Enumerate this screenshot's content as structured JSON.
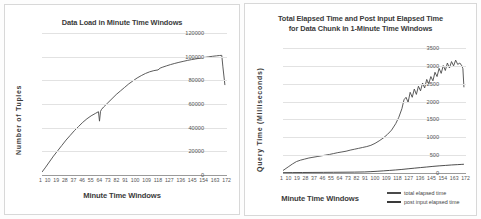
{
  "chart_data": [
    {
      "type": "line",
      "title": "Data Load in Minute Time Windows",
      "xlabel": "Minute Time Windows",
      "ylabel": "Number of Tuples",
      "xticks": [
        "1",
        "10",
        "19",
        "28",
        "37",
        "46",
        "55",
        "64",
        "73",
        "82",
        "91",
        "100",
        "109",
        "118",
        "127",
        "136",
        "145",
        "154",
        "163",
        "172"
      ],
      "yticks": [
        "0",
        "20000",
        "40000",
        "60000",
        "80000",
        "100000",
        "120000"
      ],
      "ylim": [
        0,
        120000
      ],
      "xlim": [
        1,
        178
      ],
      "grid": true,
      "legend": "none",
      "series": [
        {
          "name": "number of tuples",
          "color": "#4a4a4a",
          "x": [
            1,
            4,
            8,
            12,
            16,
            20,
            24,
            28,
            32,
            36,
            40,
            44,
            48,
            52,
            55,
            56,
            57,
            58,
            60,
            64,
            68,
            72,
            76,
            80,
            84,
            88,
            92,
            96,
            100,
            104,
            108,
            112,
            114,
            116,
            120,
            124,
            128,
            132,
            136,
            140,
            144,
            148,
            152,
            156,
            160,
            164,
            168,
            171,
            173,
            174,
            176
          ],
          "values": [
            2500,
            6000,
            11000,
            16000,
            20500,
            25000,
            29500,
            33500,
            37500,
            41000,
            44500,
            47500,
            50000,
            52000,
            53500,
            45500,
            53800,
            55500,
            57500,
            61000,
            64500,
            68000,
            71000,
            74000,
            77000,
            79500,
            82000,
            84000,
            85800,
            87200,
            88200,
            88800,
            90300,
            91000,
            92200,
            93300,
            94300,
            95200,
            96000,
            96800,
            97500,
            98100,
            98700,
            99300,
            99800,
            100300,
            100700,
            101000,
            101100,
            92000,
            76000
          ]
        }
      ]
    },
    {
      "type": "line",
      "title_line1": "Total Elapsed Time and Post Input Elapsed Time",
      "title_line2": "for Data Chunk in 1-Minute Time Windows",
      "xlabel": "Minute Time Windows",
      "ylabel": "Query Time (Milliseconds)",
      "xticks": [
        "1",
        "10",
        "19",
        "28",
        "37",
        "46",
        "55",
        "64",
        "73",
        "82",
        "91",
        "100",
        "109",
        "118",
        "127",
        "136",
        "145",
        "154",
        "163",
        "172"
      ],
      "yticks": [
        "0",
        "500",
        "1000",
        "1500",
        "2000",
        "2500",
        "3000",
        "3500"
      ],
      "ylim": [
        0,
        3500
      ],
      "xlim": [
        1,
        178
      ],
      "grid": true,
      "legend_position": "bottom-right",
      "series": [
        {
          "name": "total elapsed time",
          "color": "#4a4a4a",
          "x": [
            1,
            3,
            6,
            10,
            14,
            18,
            22,
            26,
            30,
            34,
            38,
            42,
            46,
            50,
            54,
            58,
            62,
            66,
            70,
            74,
            78,
            82,
            86,
            90,
            94,
            98,
            102,
            106,
            110,
            113,
            116,
            118,
            120,
            122,
            124,
            126,
            128,
            130,
            132,
            134,
            136,
            138,
            140,
            142,
            144,
            146,
            148,
            150,
            152,
            154,
            156,
            158,
            160,
            162,
            164,
            166,
            168,
            170,
            172,
            174,
            175,
            176
          ],
          "values": [
            70,
            110,
            170,
            250,
            320,
            360,
            390,
            420,
            440,
            460,
            480,
            500,
            520,
            545,
            570,
            590,
            610,
            640,
            665,
            690,
            715,
            740,
            775,
            830,
            900,
            980,
            1080,
            1200,
            1380,
            1560,
            1800,
            2050,
            2120,
            1980,
            2260,
            2120,
            2350,
            2200,
            2430,
            2300,
            2520,
            2380,
            2620,
            2500,
            2700,
            2580,
            2820,
            2700,
            2930,
            2790,
            3010,
            2870,
            3080,
            2940,
            3120,
            3000,
            3160,
            3040,
            3080,
            3000,
            2920,
            2400
          ]
        },
        {
          "name": "post input elapsed time",
          "color": "#3a3a3a",
          "x": [
            1,
            10,
            20,
            30,
            40,
            50,
            60,
            70,
            80,
            86,
            92,
            98,
            104,
            110,
            116,
            122,
            128,
            134,
            140,
            146,
            152,
            158,
            164,
            170,
            174,
            176
          ],
          "values": [
            10,
            12,
            14,
            16,
            18,
            20,
            22,
            25,
            30,
            38,
            48,
            60,
            72,
            85,
            100,
            118,
            135,
            152,
            168,
            185,
            200,
            212,
            225,
            235,
            242,
            245
          ]
        }
      ]
    }
  ]
}
